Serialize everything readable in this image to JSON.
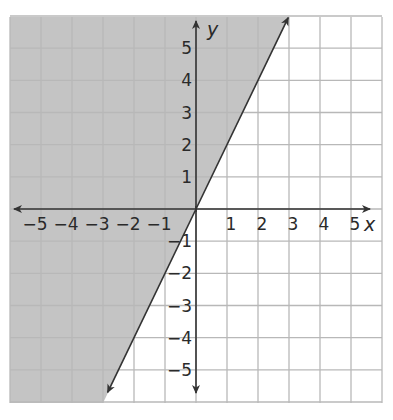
{
  "chart_data": {
    "type": "line",
    "title": "",
    "subtitle": "",
    "xlabel": "x",
    "ylabel": "y",
    "xlim": [
      -6,
      6
    ],
    "ylim": [
      -6,
      6
    ],
    "grid": true,
    "legend": null,
    "x_ticks": [
      "−5",
      "−4",
      "−3",
      "−2",
      "−1",
      "1",
      "2",
      "3",
      "4",
      "5"
    ],
    "y_ticks": [
      "5",
      "4",
      "3",
      "2",
      "1",
      "−1",
      "−2",
      "−3",
      "−4",
      "−5"
    ],
    "series": [
      {
        "name": "boundary line y = 2x",
        "slope": 2,
        "intercept": 0,
        "points": [
          [
            -3,
            -6
          ],
          [
            -2,
            -4
          ],
          [
            -1,
            -2
          ],
          [
            0,
            0
          ],
          [
            1,
            2
          ],
          [
            2,
            4
          ],
          [
            3,
            6
          ]
        ],
        "style": "solid",
        "arrows": "both"
      }
    ],
    "shaded_region": {
      "side": "left/above line",
      "inequality": "y > 2x",
      "color": "#c4c4c4"
    }
  },
  "labels": {
    "x_axis": "x",
    "y_axis": "y",
    "x_ticks": [
      {
        "value": -5,
        "text": "−5"
      },
      {
        "value": -4,
        "text": "−4"
      },
      {
        "value": -3,
        "text": "−3"
      },
      {
        "value": -2,
        "text": "−2"
      },
      {
        "value": -1,
        "text": "−1"
      },
      {
        "value": 1,
        "text": "1"
      },
      {
        "value": 2,
        "text": "2"
      },
      {
        "value": 3,
        "text": "3"
      },
      {
        "value": 4,
        "text": "4"
      },
      {
        "value": 5,
        "text": "5"
      }
    ],
    "y_ticks": [
      {
        "value": 5,
        "text": "5"
      },
      {
        "value": 4,
        "text": "4"
      },
      {
        "value": 3,
        "text": "3"
      },
      {
        "value": 2,
        "text": "2"
      },
      {
        "value": 1,
        "text": "1"
      },
      {
        "value": -1,
        "text": "−1"
      },
      {
        "value": -2,
        "text": "−2"
      },
      {
        "value": -3,
        "text": "−3"
      },
      {
        "value": -4,
        "text": "−4"
      },
      {
        "value": -5,
        "text": "−5"
      }
    ]
  },
  "colors": {
    "shade": "#c4c4c4",
    "grid": "#b8b8b8",
    "axis": "#333333",
    "line": "#333333",
    "background": "#ffffff"
  }
}
